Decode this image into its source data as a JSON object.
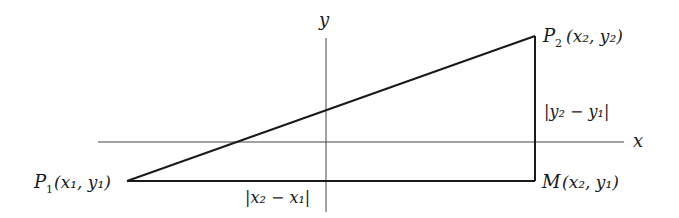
{
  "diagram": {
    "axes": {
      "x_label": "x",
      "y_label": "y"
    },
    "points": {
      "p1": {
        "name": "P",
        "sub": "1",
        "coords": "(x₁, y₁)"
      },
      "p2": {
        "name": "P",
        "sub": "2",
        "coords": "(x₂, y₂)"
      },
      "m": {
        "name": "M",
        "coords": "(x₂, y₁)"
      }
    },
    "distances": {
      "horizontal": "|x₂ − x₁|",
      "vertical": "|y₂ − y₁|"
    },
    "colors": {
      "line": "#1a1a1a",
      "axis": "#444444",
      "background": "#ffffff"
    }
  }
}
